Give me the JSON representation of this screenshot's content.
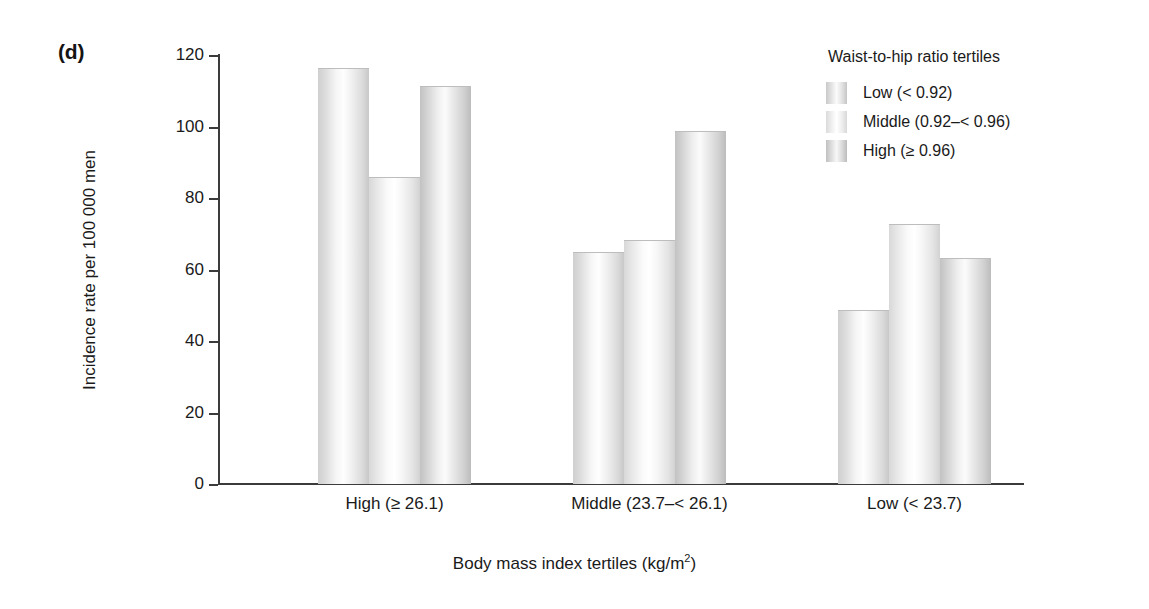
{
  "panel": {
    "label": "(d)"
  },
  "chart_data": {
    "type": "bar",
    "title": "",
    "subtitle": "",
    "xlabel": "Body mass index tertiles (kg/m",
    "xlabel_sup": "2",
    "xlabel_tail": ")",
    "ylabel": "Incidence rate per 100 000 men",
    "categories": [
      "High (≥ 26.1)",
      "Middle (23.7–< 26.1)",
      "Low (< 23.7)"
    ],
    "series": [
      {
        "name": "Low (< 0.92)",
        "values": [
          116,
          64.5,
          48.5
        ]
      },
      {
        "name": "Middle (0.92–< 0.96)",
        "values": [
          85.5,
          68,
          72.5
        ]
      },
      {
        "name": "High (≥ 0.96)",
        "values": [
          111,
          98.5,
          63
        ]
      }
    ],
    "ylim": [
      0,
      120
    ],
    "yticks": [
      0,
      20,
      40,
      60,
      80,
      100,
      120
    ],
    "ytick_labels": [
      "0",
      "20",
      "40",
      "60",
      "80",
      "100",
      "120"
    ],
    "grid": false,
    "legend_position": "top-right"
  },
  "legend": {
    "title": "Waist-to-hip ratio tertiles",
    "items": [
      {
        "label": "Low (< 0.92)",
        "shade": "shade-low"
      },
      {
        "label": "Middle (0.92–< 0.96)",
        "shade": "shade-middle"
      },
      {
        "label": "High (≥ 0.96)",
        "shade": "shade-high"
      }
    ]
  },
  "colors": {
    "axis": "#3b3b3b",
    "text": "#1a1a1a",
    "background": "#ffffff",
    "bar_light": "#fdfdfd",
    "bar_dark": "#c2c2c2"
  }
}
